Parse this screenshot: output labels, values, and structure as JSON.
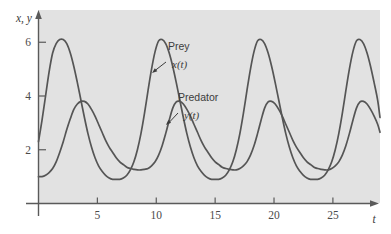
{
  "chart_data": {
    "type": "line",
    "title": "",
    "subtitle": "",
    "xlabel": "t",
    "ylabel": "x, y",
    "xlim": [
      0,
      29
    ],
    "ylim": [
      0,
      7.2
    ],
    "grid": false,
    "legend_position": "inline-annotations",
    "background_color": "#e2e2e2",
    "curve_color": "#555555",
    "axis_color": "#5a5a5a",
    "xticks": [
      5,
      10,
      15,
      20,
      25
    ],
    "xtick_labels": [
      "5",
      "10",
      "15",
      "20",
      "25"
    ],
    "yticks": [
      2,
      4,
      6
    ],
    "ytick_labels": [
      "2",
      "4",
      "6"
    ],
    "annotations": [
      {
        "id": "prey",
        "label": "Prey",
        "function": "x(t)",
        "label_x": 168,
        "label_y": 50,
        "func_x": 172,
        "func_y": 68,
        "arrow_from_x": 166,
        "arrow_from_y": 62,
        "arrow_to_x": 152,
        "arrow_to_y": 73
      },
      {
        "id": "predator",
        "label": "Predator",
        "function": "y(t)",
        "label_x": 178,
        "label_y": 101,
        "func_x": 184,
        "func_y": 119,
        "arrow_from_x": 178,
        "arrow_from_y": 113,
        "arrow_to_x": 166,
        "arrow_to_y": 125
      }
    ],
    "series": [
      {
        "name": "Prey x(t)",
        "symbol": "x(t)",
        "color": "#555555",
        "period": 7.5,
        "peak_value": 6.1,
        "trough_value": 0.9,
        "initial_value": 2.3,
        "peak_times": [
          2.6,
          10.2,
          17.7,
          25.2
        ],
        "trough_times": [
          6.9,
          14.4,
          21.9
        ],
        "x": [
          0.0,
          0.3,
          0.6,
          0.9,
          1.2,
          1.5,
          1.8,
          2.1,
          2.4,
          2.7,
          3.0,
          3.3,
          3.6,
          3.9,
          4.2,
          4.5,
          4.8,
          5.1,
          5.4,
          5.7,
          6.0,
          6.3,
          6.6,
          6.9,
          7.2,
          7.5,
          7.8,
          8.1,
          8.4,
          8.7,
          9.0,
          9.3,
          9.6,
          9.9,
          10.2,
          10.5,
          10.8,
          11.1,
          11.4,
          11.7,
          12.0,
          12.3,
          12.6,
          12.9,
          13.2,
          13.5,
          13.8,
          14.1,
          14.4,
          14.7,
          15.0,
          15.3,
          15.6,
          15.9,
          16.2,
          16.5,
          16.8,
          17.1,
          17.4,
          17.7,
          18.0,
          18.3,
          18.6,
          18.9,
          19.2,
          19.5,
          19.8,
          20.1,
          20.4,
          20.7,
          21.0,
          21.3,
          21.6,
          21.9,
          22.2,
          22.5,
          22.8,
          23.1,
          23.4,
          23.7,
          24.0,
          24.3,
          24.6,
          24.9,
          25.2,
          25.5,
          25.8,
          26.1,
          26.4,
          26.7,
          27.0,
          27.3,
          27.6,
          27.9,
          28.2,
          28.5,
          28.8,
          29.0
        ],
        "values": [
          2.3,
          3.1,
          4.0,
          4.9,
          5.6,
          5.95,
          6.1,
          6.1,
          5.95,
          5.6,
          5.1,
          4.5,
          3.85,
          3.2,
          2.6,
          2.1,
          1.7,
          1.4,
          1.2,
          1.05,
          0.95,
          0.9,
          0.9,
          0.9,
          0.95,
          1.05,
          1.25,
          1.55,
          2.0,
          2.6,
          3.35,
          4.2,
          5.0,
          5.65,
          6.05,
          6.1,
          5.95,
          5.6,
          5.1,
          4.5,
          3.85,
          3.2,
          2.6,
          2.1,
          1.7,
          1.4,
          1.2,
          1.05,
          0.95,
          0.9,
          0.9,
          0.9,
          0.95,
          1.05,
          1.25,
          1.55,
          2.0,
          2.6,
          3.35,
          4.2,
          5.0,
          5.65,
          6.05,
          6.1,
          5.95,
          5.6,
          5.1,
          4.5,
          3.85,
          3.2,
          2.6,
          2.1,
          1.7,
          1.4,
          1.2,
          1.05,
          0.95,
          0.9,
          0.9,
          0.9,
          0.95,
          1.05,
          1.25,
          1.55,
          2.0,
          2.6,
          3.35,
          4.2,
          5.0,
          5.65,
          6.05,
          6.1,
          5.95,
          5.6,
          5.1,
          4.5,
          3.85,
          3.2
        ]
      },
      {
        "name": "Predator y(t)",
        "symbol": "y(t)",
        "color": "#555555",
        "period": 7.5,
        "peak_value": 3.8,
        "trough_value": 1.25,
        "initial_value": 1.0,
        "peak_times": [
          3.9,
          11.4,
          18.9,
          26.4
        ],
        "trough_times": [
          8.2,
          15.7,
          23.2
        ],
        "x": [
          0.0,
          0.3,
          0.6,
          0.9,
          1.2,
          1.5,
          1.8,
          2.1,
          2.4,
          2.7,
          3.0,
          3.3,
          3.6,
          3.9,
          4.2,
          4.5,
          4.8,
          5.1,
          5.4,
          5.7,
          6.0,
          6.3,
          6.6,
          6.9,
          7.2,
          7.5,
          7.8,
          8.1,
          8.4,
          8.7,
          9.0,
          9.3,
          9.6,
          9.9,
          10.2,
          10.5,
          10.8,
          11.1,
          11.4,
          11.7,
          12.0,
          12.3,
          12.6,
          12.9,
          13.2,
          13.5,
          13.8,
          14.1,
          14.4,
          14.7,
          15.0,
          15.3,
          15.6,
          15.9,
          16.2,
          16.5,
          16.8,
          17.1,
          17.4,
          17.7,
          18.0,
          18.3,
          18.6,
          18.9,
          19.2,
          19.5,
          19.8,
          20.1,
          20.4,
          20.7,
          21.0,
          21.3,
          21.6,
          21.9,
          22.2,
          22.5,
          22.8,
          23.1,
          23.4,
          23.7,
          24.0,
          24.3,
          24.6,
          24.9,
          25.2,
          25.5,
          25.8,
          26.1,
          26.4,
          26.7,
          27.0,
          27.3,
          27.6,
          27.9,
          28.2,
          28.5,
          28.8,
          29.0
        ],
        "values": [
          1.0,
          1.0,
          1.05,
          1.15,
          1.3,
          1.55,
          1.9,
          2.3,
          2.75,
          3.15,
          3.5,
          3.7,
          3.8,
          3.8,
          3.7,
          3.5,
          3.25,
          2.95,
          2.65,
          2.35,
          2.1,
          1.9,
          1.7,
          1.55,
          1.45,
          1.35,
          1.3,
          1.27,
          1.25,
          1.25,
          1.27,
          1.3,
          1.4,
          1.55,
          1.8,
          2.15,
          2.6,
          3.1,
          3.55,
          3.78,
          3.8,
          3.7,
          3.5,
          3.25,
          2.95,
          2.65,
          2.35,
          2.1,
          1.9,
          1.7,
          1.55,
          1.45,
          1.35,
          1.3,
          1.27,
          1.25,
          1.25,
          1.3,
          1.4,
          1.55,
          1.8,
          2.15,
          2.6,
          3.1,
          3.55,
          3.78,
          3.8,
          3.7,
          3.5,
          3.25,
          2.95,
          2.65,
          2.35,
          2.1,
          1.9,
          1.7,
          1.55,
          1.45,
          1.35,
          1.3,
          1.27,
          1.25,
          1.25,
          1.3,
          1.4,
          1.55,
          1.8,
          2.15,
          2.6,
          3.1,
          3.55,
          3.78,
          3.8,
          3.7,
          3.5,
          3.25,
          2.95,
          2.65
        ]
      }
    ]
  }
}
